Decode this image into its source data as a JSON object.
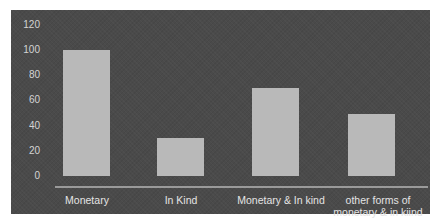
{
  "chart_data": {
    "type": "bar",
    "title": "",
    "xlabel": "",
    "ylabel": "",
    "categories": [
      "Monetary",
      "In Kind",
      "Monetary & In kind",
      "other forms of monetary & in kiind"
    ],
    "values": [
      100,
      30,
      70,
      49
    ],
    "ylim": [
      0,
      120
    ],
    "yticks": [
      0,
      20,
      40,
      60,
      80,
      100,
      120
    ],
    "grid": false,
    "legend": "none",
    "colors": {
      "background": "#4a4a4a",
      "bar": "#b9b9b9",
      "text": "#d4d4d4",
      "axis": "#9a9a9a"
    }
  },
  "labels": {
    "yticks": [
      "0",
      "20",
      "40",
      "60",
      "80",
      "100",
      "120"
    ],
    "x": {
      "c0": "Monetary",
      "c1": "In Kind",
      "c2": "Monetary & In kind",
      "c3_line1": "other forms of",
      "c3_line2": "monetary & in kiind"
    }
  }
}
